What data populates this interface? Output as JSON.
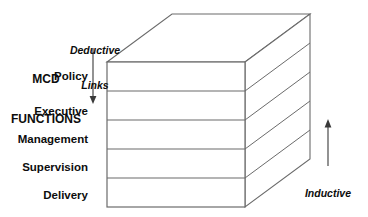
{
  "diagram": {
    "title_block": {
      "line1": "MCD",
      "line2": "FUNCTIONS"
    },
    "deductive": {
      "line1": "Deductive",
      "line2": "Links",
      "arrow": "down-arrow-icon"
    },
    "inductive": {
      "line1": "Inductive",
      "line2": "Links",
      "arrow": "up-arrow-icon"
    },
    "layers": [
      {
        "label": "Policy"
      },
      {
        "label": "Executive"
      },
      {
        "label": "Management"
      },
      {
        "label": "Supervision"
      },
      {
        "label": "Delivery"
      }
    ],
    "colors": {
      "stroke": "#6b6b6b",
      "stroke_dark": "#4a4a4a",
      "text": "#0d0d0d",
      "background": "#ffffff",
      "face": "#ffffff"
    }
  }
}
